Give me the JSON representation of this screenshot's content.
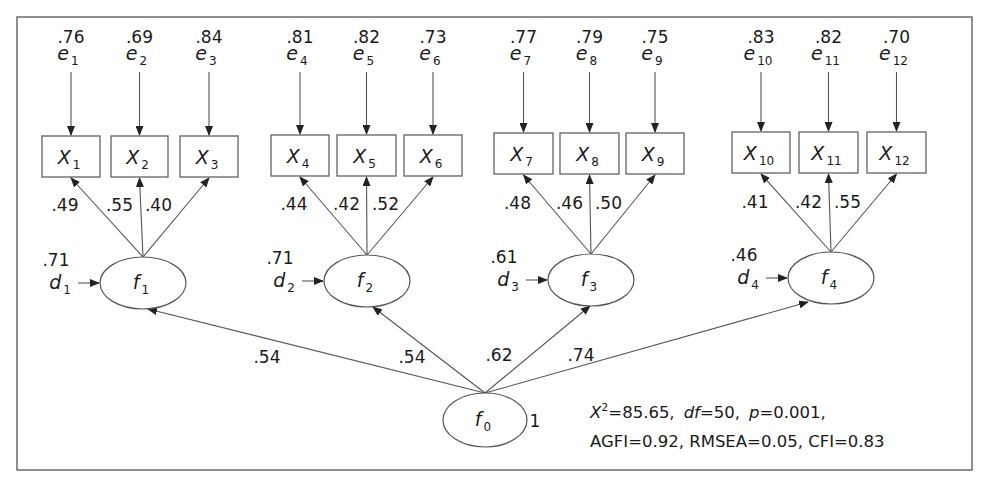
{
  "frame": {
    "x": 17,
    "y": 17,
    "w": 955,
    "h": 453,
    "stroke": "#555555"
  },
  "observed": [
    {
      "id": "X",
      "sub": "1",
      "x": 42,
      "y": 136,
      "w": 58,
      "h": 41,
      "error": {
        "label": "e",
        "sub": "1",
        "variance": ".76"
      },
      "loading": ".49"
    },
    {
      "id": "X",
      "sub": "2",
      "x": 111,
      "y": 136,
      "w": 57,
      "h": 41,
      "error": {
        "label": "e",
        "sub": "2",
        "variance": ".69"
      },
      "loading": ".55"
    },
    {
      "id": "X",
      "sub": "3",
      "x": 180,
      "y": 136,
      "w": 58,
      "h": 41,
      "error": {
        "label": "e",
        "sub": "3",
        "variance": ".84"
      },
      "loading": ".40"
    },
    {
      "id": "X",
      "sub": "4",
      "x": 271,
      "y": 135,
      "w": 58,
      "h": 41,
      "error": {
        "label": "e",
        "sub": "4",
        "variance": ".81"
      },
      "loading": ".44"
    },
    {
      "id": "X",
      "sub": "5",
      "x": 337,
      "y": 135,
      "w": 59,
      "h": 41,
      "error": {
        "label": "e",
        "sub": "5",
        "variance": ".82"
      },
      "loading": ".42"
    },
    {
      "id": "X",
      "sub": "6",
      "x": 404,
      "y": 135,
      "w": 58,
      "h": 41,
      "error": {
        "label": "e",
        "sub": "6",
        "variance": ".73"
      },
      "loading": ".52"
    },
    {
      "id": "X",
      "sub": "7",
      "x": 494,
      "y": 133,
      "w": 59,
      "h": 41,
      "error": {
        "label": "e",
        "sub": "7",
        "variance": ".77"
      },
      "loading": ".48"
    },
    {
      "id": "X",
      "sub": "8",
      "x": 560,
      "y": 133,
      "w": 59,
      "h": 41,
      "error": {
        "label": "e",
        "sub": "8",
        "variance": ".79"
      },
      "loading": ".46"
    },
    {
      "id": "X",
      "sub": "9",
      "x": 626,
      "y": 133,
      "w": 58,
      "h": 41,
      "error": {
        "label": "e",
        "sub": "9",
        "variance": ".75"
      },
      "loading": ".50"
    },
    {
      "id": "X",
      "sub": "10",
      "x": 732,
      "y": 132,
      "w": 58,
      "h": 41,
      "error": {
        "label": "e",
        "sub": "10",
        "variance": ".83"
      },
      "loading": ".41"
    },
    {
      "id": "X",
      "sub": "11",
      "x": 799,
      "y": 132,
      "w": 59,
      "h": 41,
      "error": {
        "label": "e",
        "sub": "11",
        "variance": ".82"
      },
      "loading": ".42"
    },
    {
      "id": "X",
      "sub": "12",
      "x": 867,
      "y": 132,
      "w": 59,
      "h": 41,
      "error": {
        "label": "e",
        "sub": "12",
        "variance": ".70"
      },
      "loading": ".55"
    }
  ],
  "factors": [
    {
      "label": "f",
      "sub": "1",
      "cx": 143,
      "cy": 283,
      "rx": 43,
      "ry": 26,
      "disturbance": {
        "label": "d",
        "sub": "1",
        "variance": ".71"
      },
      "path_from_f0": ".54"
    },
    {
      "label": "f",
      "sub": "2",
      "cx": 367,
      "cy": 281,
      "rx": 43,
      "ry": 26,
      "disturbance": {
        "label": "d",
        "sub": "2",
        "variance": ".71"
      },
      "path_from_f0": ".54"
    },
    {
      "label": "f",
      "sub": "3",
      "cx": 591,
      "cy": 280,
      "rx": 43,
      "ry": 26,
      "disturbance": {
        "label": "d",
        "sub": "3",
        "variance": ".61"
      },
      "path_from_f0": ".62"
    },
    {
      "label": "f",
      "sub": "4",
      "cx": 831,
      "cy": 278,
      "rx": 43,
      "ry": 26,
      "disturbance": {
        "label": "d",
        "sub": "4",
        "variance": ".46"
      },
      "path_from_f0": ".74"
    }
  ],
  "general_factor": {
    "label": "f",
    "sub": "0",
    "cx": 485,
    "cy": 420,
    "rx": 42,
    "ry": 27,
    "variance": "1"
  },
  "path_label_positions": [
    {
      "x": 253,
      "y": 363
    },
    {
      "x": 398,
      "y": 363
    },
    {
      "x": 485,
      "y": 361
    },
    {
      "x": 567,
      "y": 361
    }
  ],
  "fit_stats": {
    "line1": [
      {
        "k": "X",
        "sup": "2",
        "italic": true,
        "v": "=85.65,"
      },
      {
        "k": "df",
        "italic": true,
        "v": "=50,"
      },
      {
        "k": "p",
        "italic": true,
        "v": "=0.001,"
      }
    ],
    "line2": "AGFI=0.92,  RMSEA=0.05,  CFI=0.83",
    "x": 590,
    "y1": 418,
    "y2": 447
  },
  "chi_square": "85.65",
  "df": "50",
  "p_value": "0.001",
  "agfi": "0.92",
  "rmsea": "0.05",
  "cfi": "0.83"
}
